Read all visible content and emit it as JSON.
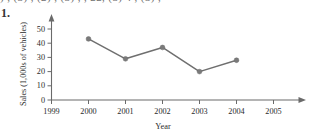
{
  "page": {
    "item_number": "1.",
    "cutoff_text_above": ") , (3) , (2)  , (3)  ,  ,  22, (3) 4 , (3) ,"
  },
  "chart_data": {
    "type": "line",
    "title": "",
    "xlabel": "Year",
    "ylabel": "Sales (1,000s of vehicles)",
    "x": [
      2000,
      2001,
      2002,
      2003,
      2004
    ],
    "values": [
      43,
      29,
      37,
      20,
      28
    ],
    "xticklabels": [
      "1999",
      "2000",
      "2001",
      "2002",
      "2003",
      "2004",
      "2005"
    ],
    "xticks": [
      1999,
      2000,
      2001,
      2002,
      2003,
      2004,
      2005
    ],
    "yticklabels": [
      "0",
      "10",
      "20",
      "30",
      "40",
      "50"
    ],
    "yticks": [
      0,
      10,
      20,
      30,
      40,
      50
    ],
    "xlim": [
      1999,
      2005
    ],
    "ylim": [
      0,
      55
    ],
    "grid": false,
    "legend": "none",
    "marker": "circle",
    "line_color": "#6f6f6f",
    "marker_color": "#7a7a7a",
    "axis_color": "#6a6a6a",
    "axis_arrows": true
  }
}
